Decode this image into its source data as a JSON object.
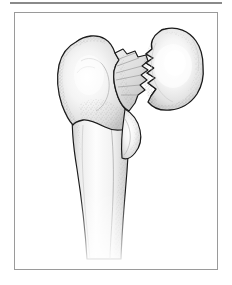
{
  "figure": {
    "kind": "medical-illustration",
    "alt_text": "Line drawing of the upper end of a femur showing a jagged, comminuted fracture across the femoral neck separating the rounded femoral head from the trochanteric region and shaft.",
    "style": "stippled pen-and-ink anatomical drawing, grayscale"
  },
  "frame": {
    "border_color": "#9a9a9a",
    "background_color": "#ffffff",
    "rule_color": "#8a8a8a"
  },
  "palette": {
    "outline": "#1a1a1a",
    "bone_light": "#fbfbfb",
    "bone_mid": "#e3e3e3",
    "bone_shadow": "#b9b9b9",
    "stipple": "#6e6e6e",
    "highlight": "#ffffff"
  },
  "anatomy": {
    "parts": [
      {
        "id": "femoral-head",
        "label": "Femoral head"
      },
      {
        "id": "fracture-line",
        "label": "Fracture line"
      },
      {
        "id": "greater-trochanter",
        "label": "Greater trochanter"
      },
      {
        "id": "lesser-trochanter",
        "label": "Lesser trochanter"
      },
      {
        "id": "femoral-shaft",
        "label": "Femoral shaft"
      }
    ]
  }
}
